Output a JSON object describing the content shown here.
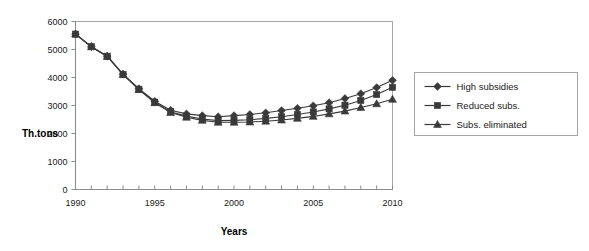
{
  "chart_data": {
    "type": "line",
    "title": "",
    "xlabel": "Years",
    "ylabel": "Th.tons",
    "xlim": [
      1990,
      2010
    ],
    "ylim": [
      0,
      6000
    ],
    "grid": true,
    "legend_position": "right",
    "x": [
      1990,
      1991,
      1992,
      1993,
      1994,
      1995,
      1996,
      1997,
      1998,
      1999,
      2000,
      2001,
      2002,
      2003,
      2004,
      2005,
      2006,
      2007,
      2008,
      2009,
      2010
    ],
    "xticks": [
      1990,
      1995,
      2000,
      2005,
      2010
    ],
    "xtick_labels": [
      "1990",
      "1995",
      "2000",
      "2005",
      "2010"
    ],
    "yticks": [
      0,
      1000,
      2000,
      3000,
      4000,
      5000,
      6000
    ],
    "ytick_labels": [
      "0",
      "1000",
      "2000",
      "3000",
      "4000",
      "5000",
      "6000"
    ],
    "series": [
      {
        "name": "High subsidies",
        "marker": "diamond",
        "color": "#3a3a3a",
        "values": [
          5550,
          5100,
          4760,
          4120,
          3600,
          3150,
          2830,
          2700,
          2640,
          2600,
          2640,
          2680,
          2740,
          2820,
          2900,
          2990,
          3100,
          3250,
          3420,
          3640,
          3900
        ]
      },
      {
        "name": "Reduced subs.",
        "marker": "square",
        "color": "#3a3a3a",
        "values": [
          5550,
          5100,
          4760,
          4110,
          3580,
          3120,
          2780,
          2620,
          2520,
          2460,
          2470,
          2490,
          2540,
          2600,
          2680,
          2770,
          2880,
          3010,
          3180,
          3390,
          3650
        ]
      },
      {
        "name": "Subs. eliminated",
        "marker": "triangle",
        "color": "#3a3a3a",
        "values": [
          5550,
          5100,
          4750,
          4100,
          3570,
          3100,
          2750,
          2580,
          2470,
          2400,
          2400,
          2410,
          2440,
          2480,
          2540,
          2610,
          2700,
          2800,
          2930,
          3060,
          3220
        ]
      }
    ]
  },
  "legend": {
    "items": [
      {
        "label": "High subsidies",
        "marker": "diamond"
      },
      {
        "label": "Reduced subs.",
        "marker": "square"
      },
      {
        "label": "Subs. eliminated",
        "marker": "triangle"
      }
    ]
  },
  "axes": {
    "x_title": "Years",
    "y_title": "Th.tons"
  }
}
